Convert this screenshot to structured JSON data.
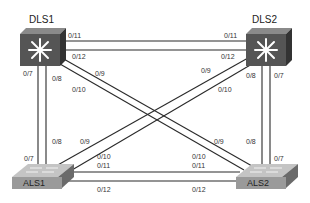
{
  "diagram": {
    "type": "network-topology",
    "devices": [
      {
        "id": "DLS1",
        "label": "DLS1",
        "kind": "multilayer-switch"
      },
      {
        "id": "DLS2",
        "label": "DLS2",
        "kind": "multilayer-switch"
      },
      {
        "id": "ALS1",
        "label": "ALS1",
        "kind": "access-switch"
      },
      {
        "id": "ALS2",
        "label": "ALS2",
        "kind": "access-switch"
      }
    ],
    "links": [
      {
        "a": "DLS1",
        "a_port": "0/11",
        "b": "DLS2",
        "b_port": "0/11"
      },
      {
        "a": "DLS1",
        "a_port": "0/12",
        "b": "DLS2",
        "b_port": "0/12"
      },
      {
        "a": "DLS1",
        "a_port": "0/7",
        "b": "ALS1",
        "b_port": "0/7"
      },
      {
        "a": "DLS1",
        "a_port": "0/8",
        "b": "ALS1",
        "b_port": "0/8"
      },
      {
        "a": "DLS1",
        "a_port": "0/9",
        "b": "ALS2",
        "b_port": "0/9"
      },
      {
        "a": "DLS1",
        "a_port": "0/10",
        "b": "ALS2",
        "b_port": "0/10"
      },
      {
        "a": "DLS2",
        "a_port": "0/7",
        "b": "ALS2",
        "b_port": "0/7"
      },
      {
        "a": "DLS2",
        "a_port": "0/8",
        "b": "ALS2",
        "b_port": "0/8"
      },
      {
        "a": "DLS2",
        "a_port": "0/9",
        "b": "ALS1",
        "b_port": "0/9"
      },
      {
        "a": "DLS2",
        "a_port": "0/10",
        "b": "ALS1",
        "b_port": "0/10"
      },
      {
        "a": "ALS1",
        "a_port": "0/11",
        "b": "ALS2",
        "b_port": "0/11"
      },
      {
        "a": "ALS1",
        "a_port": "0/12",
        "b": "ALS2",
        "b_port": "0/12"
      }
    ],
    "port_labels": {
      "dls1_11": "0/11",
      "dls1_12": "0/12",
      "dls1_7": "0/7",
      "dls1_8": "0/8",
      "dls1_9": "0/9",
      "dls1_10": "0/10",
      "dls2_11": "0/11",
      "dls2_12": "0/12",
      "dls2_9": "0/9",
      "dls2_10": "0/10",
      "dls2_8": "0/8",
      "dls2_7": "0/7",
      "als1_8": "0/8",
      "als1_9": "0/9",
      "als1_7": "0/7",
      "als1_10": "0/10",
      "als1_11": "0/11",
      "als1_12": "0/12",
      "als2_9": "0/9",
      "als2_8": "0/8",
      "als2_10": "0/10",
      "als2_11": "0/11",
      "als2_7": "0/7",
      "als2_12": "0/12"
    },
    "colors": {
      "line": "#2a2a2a",
      "switch_front": "#555555",
      "switch_top": "#8a8a8a",
      "switch_side": "#333333",
      "access_front": "#9a9a9a",
      "access_top": "#c4c4c4"
    }
  }
}
